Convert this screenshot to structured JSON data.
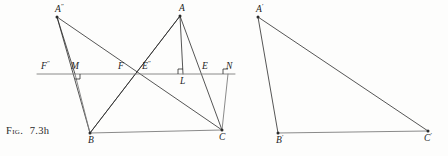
{
  "caption": {
    "prefix": "Fig.",
    "number": "7.3h"
  },
  "colors": {
    "stroke": "#2b2b2b",
    "stroke_light": "#7d7d7d",
    "background": "#fdfdfc",
    "label": "#1c1c1c"
  },
  "figure": {
    "kind": "geometry-construction",
    "left_diagram": {
      "points": [
        {
          "name": "A-double-prime",
          "label": "A",
          "prime": "″",
          "x": 57,
          "y": 17,
          "label_dx": -2,
          "label_dy": -12
        },
        {
          "name": "A",
          "label": "A",
          "prime": "",
          "x": 180,
          "y": 16,
          "label_dx": -1,
          "label_dy": -12
        },
        {
          "name": "B",
          "label": "B",
          "prime": "",
          "x": 90,
          "y": 133,
          "label_dx": -2,
          "label_dy": 3
        },
        {
          "name": "C",
          "label": "C",
          "prime": "",
          "x": 222,
          "y": 130,
          "label_dx": -3,
          "label_dy": 3
        },
        {
          "name": "F-double-prime",
          "label": "F",
          "prime": "″",
          "x": 50,
          "y": 74,
          "label_dx": -9,
          "label_dy": -12
        },
        {
          "name": "M",
          "label": "M",
          "prime": "",
          "x": 75,
          "y": 74,
          "label_dx": -4,
          "label_dy": -12
        },
        {
          "name": "F",
          "label": "F",
          "prime": "",
          "x": 124,
          "y": 74,
          "label_dx": -6,
          "label_dy": -12
        },
        {
          "name": "E-double-prime",
          "label": "E",
          "prime": "″",
          "x": 141,
          "y": 74,
          "label_dx": 1,
          "label_dy": -12
        },
        {
          "name": "L",
          "label": "L",
          "prime": "",
          "x": 183,
          "y": 74,
          "label_dx": -3,
          "label_dy": 3
        },
        {
          "name": "E",
          "label": "E",
          "prime": "",
          "x": 205,
          "y": 74,
          "label_dx": -3,
          "label_dy": -12
        },
        {
          "name": "N",
          "label": "N",
          "prime": "",
          "x": 228,
          "y": 74,
          "label_dx": -2,
          "label_dy": -12
        }
      ],
      "transversal": {
        "x1": 37,
        "y1": 74,
        "x2": 235,
        "y2": 74
      },
      "segments": [
        {
          "name": "segment-B-C",
          "x1": 90,
          "y1": 133,
          "x2": 222,
          "y2": 130,
          "weight": "light"
        },
        {
          "name": "segment-A-B",
          "x1": 180,
          "y1": 16,
          "x2": 90,
          "y2": 133,
          "weight": "normal"
        },
        {
          "name": "segment-A-C",
          "x1": 180,
          "y1": 16,
          "x2": 222,
          "y2": 130,
          "weight": "normal"
        },
        {
          "name": "segment-A-L-altitude",
          "x1": 180,
          "y1": 16,
          "x2": 183,
          "y2": 74,
          "weight": "normal"
        },
        {
          "name": "segment-Adp-B",
          "x1": 57,
          "y1": 17,
          "x2": 90,
          "y2": 133,
          "weight": "normal"
        },
        {
          "name": "segment-Adp-C",
          "x1": 57,
          "y1": 17,
          "x2": 222,
          "y2": 130,
          "weight": "normal"
        },
        {
          "name": "segment-Adp-M-altitude",
          "x1": 57,
          "y1": 17,
          "x2": 75,
          "y2": 74,
          "weight": "normal"
        },
        {
          "name": "segment-M-B-vertical",
          "x1": 75,
          "y1": 74,
          "x2": 90,
          "y2": 133,
          "weight": "light"
        },
        {
          "name": "segment-N-C-vertical",
          "x1": 228,
          "y1": 74,
          "x2": 222,
          "y2": 130,
          "weight": "light"
        },
        {
          "name": "segment-B-A-extended",
          "x1": 90,
          "y1": 133,
          "x2": 180,
          "y2": 16,
          "weight": "normal"
        }
      ],
      "right_angle_marks": [
        {
          "name": "right-angle-at-M",
          "x": 75,
          "y": 74,
          "orient": "down-right"
        },
        {
          "name": "right-angle-at-L",
          "x": 183,
          "y": 74,
          "orient": "up-left"
        },
        {
          "name": "right-angle-at-N",
          "x": 228,
          "y": 74,
          "orient": "up-left"
        }
      ]
    },
    "right_diagram": {
      "points": [
        {
          "name": "A-prime",
          "label": "A",
          "prime": "′",
          "x": 258,
          "y": 17,
          "label_dx": -2,
          "label_dy": -12
        },
        {
          "name": "B-prime",
          "label": "B",
          "prime": "′",
          "x": 278,
          "y": 133,
          "label_dx": -2,
          "label_dy": 3
        },
        {
          "name": "C-prime",
          "label": "C",
          "prime": "′",
          "x": 428,
          "y": 131,
          "label_dx": -4,
          "label_dy": 3
        }
      ],
      "segments": [
        {
          "name": "segment-Ap-Bp",
          "x1": 258,
          "y1": 17,
          "x2": 278,
          "y2": 133,
          "weight": "normal"
        },
        {
          "name": "segment-Ap-Cp",
          "x1": 258,
          "y1": 17,
          "x2": 428,
          "y2": 131,
          "weight": "normal"
        },
        {
          "name": "segment-Bp-Cp",
          "x1": 278,
          "y1": 133,
          "x2": 428,
          "y2": 131,
          "weight": "light"
        }
      ]
    }
  }
}
